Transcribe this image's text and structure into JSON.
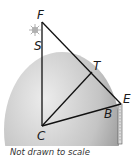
{
  "figure": {
    "points": [
      {
        "id": "F",
        "label": "F",
        "x": 42,
        "y": 22,
        "lx": 37,
        "ly": 19
      },
      {
        "id": "S",
        "label": "S",
        "x": 42,
        "y": 52,
        "lx": 34,
        "ly": 50
      },
      {
        "id": "T",
        "label": "T",
        "x": 92,
        "y": 72,
        "lx": 93,
        "ly": 70
      },
      {
        "id": "E",
        "label": "E",
        "x": 121,
        "y": 104,
        "lx": 123,
        "ly": 103
      },
      {
        "id": "B",
        "label": "B",
        "x": 116,
        "y": 103,
        "lx": 104,
        "ly": 118
      },
      {
        "id": "C",
        "label": "C",
        "x": 42,
        "y": 126,
        "lx": 37,
        "ly": 140
      }
    ],
    "segments": [
      [
        "F",
        "C"
      ],
      [
        "F",
        "E"
      ],
      [
        "C",
        "T"
      ],
      [
        "C",
        "E"
      ]
    ],
    "caption": "Not drawn to scale"
  },
  "colors": {
    "globe_light": "#e6e6e6",
    "globe_dark": "#9a9a9a",
    "line": "#111111",
    "star": "#a8a8a8"
  }
}
